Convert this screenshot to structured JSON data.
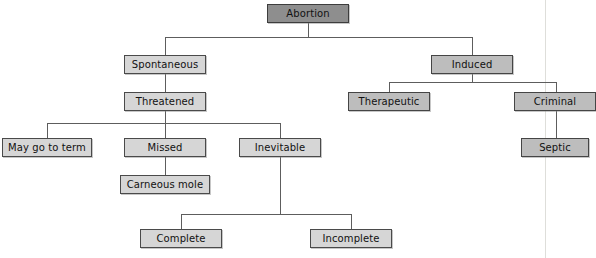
{
  "diagram": {
    "type": "flowchart",
    "background_color": "#ffffff",
    "line_color": "#5d5d5d",
    "colors": {
      "root_fill": "#8e8e8e",
      "mid_fill": "#bdbdbd",
      "leaf_fill": "#d6d6d6",
      "border": "#4a4a4a",
      "page_edge": "#d8d8d4"
    },
    "nodes": [
      {
        "id": "abortion",
        "label": "Abortion",
        "tone": "dark",
        "x": 267,
        "y": 4,
        "w": 82,
        "h": 19
      },
      {
        "id": "spontaneous",
        "label": "Spontaneous",
        "tone": "light",
        "x": 124,
        "y": 55,
        "w": 82,
        "h": 19
      },
      {
        "id": "induced",
        "label": "Induced",
        "tone": "mid",
        "x": 431,
        "y": 55,
        "w": 82,
        "h": 19
      },
      {
        "id": "threatened",
        "label": "Threatened",
        "tone": "light",
        "x": 124,
        "y": 92,
        "w": 82,
        "h": 19
      },
      {
        "id": "therapeutic",
        "label": "Therapeutic",
        "tone": "mid",
        "x": 348,
        "y": 92,
        "w": 82,
        "h": 19
      },
      {
        "id": "criminal",
        "label": "Criminal",
        "tone": "mid",
        "x": 514,
        "y": 92,
        "w": 82,
        "h": 19
      },
      {
        "id": "maygototerm",
        "label": "May go to term",
        "tone": "light",
        "x": 2,
        "y": 138,
        "w": 90,
        "h": 19
      },
      {
        "id": "missed",
        "label": "Missed",
        "tone": "light",
        "x": 124,
        "y": 138,
        "w": 82,
        "h": 19
      },
      {
        "id": "inevitable",
        "label": "Inevitable",
        "tone": "light",
        "x": 239,
        "y": 138,
        "w": 82,
        "h": 19
      },
      {
        "id": "septic",
        "label": "Septic",
        "tone": "mid",
        "x": 521,
        "y": 138,
        "w": 68,
        "h": 19
      },
      {
        "id": "carneousmole",
        "label": "Carneous mole",
        "tone": "light",
        "x": 120,
        "y": 175,
        "w": 90,
        "h": 19
      },
      {
        "id": "complete",
        "label": "Complete",
        "tone": "light",
        "x": 140,
        "y": 229,
        "w": 82,
        "h": 19
      },
      {
        "id": "incomplete",
        "label": "Incomplete",
        "tone": "light",
        "x": 310,
        "y": 229,
        "w": 82,
        "h": 19
      }
    ],
    "edges": [
      {
        "id": "abortion-drop",
        "from": "abortion",
        "to": "branch-bus-1",
        "orient": "v",
        "x": 308,
        "y": 23,
        "len": 14
      },
      {
        "id": "abortion-bus",
        "from": "abortion",
        "to": "children",
        "orient": "h",
        "x": 165,
        "y": 37,
        "len": 307
      },
      {
        "id": "spontaneous-riser",
        "from": "bus",
        "to": "spontaneous",
        "orient": "v",
        "x": 165,
        "y": 37,
        "len": 18
      },
      {
        "id": "induced-riser",
        "from": "bus",
        "to": "induced",
        "orient": "v",
        "x": 472,
        "y": 37,
        "len": 18
      },
      {
        "id": "spontaneous-threat",
        "from": "spontaneous",
        "to": "threatened",
        "orient": "v",
        "x": 165,
        "y": 74,
        "len": 18
      },
      {
        "id": "induced-drop",
        "from": "induced",
        "to": "bus2",
        "orient": "v",
        "x": 472,
        "y": 74,
        "len": 8
      },
      {
        "id": "induced-bus",
        "from": "induced",
        "to": "children",
        "orient": "h",
        "x": 389,
        "y": 82,
        "len": 167
      },
      {
        "id": "therapeutic-riser",
        "from": "bus2",
        "to": "therapeutic",
        "orient": "v",
        "x": 389,
        "y": 82,
        "len": 10
      },
      {
        "id": "criminal-riser",
        "from": "bus2",
        "to": "criminal",
        "orient": "v",
        "x": 556,
        "y": 82,
        "len": 10
      },
      {
        "id": "criminal-septic",
        "from": "criminal",
        "to": "septic",
        "orient": "v",
        "x": 556,
        "y": 111,
        "len": 27
      },
      {
        "id": "threatened-drop",
        "from": "threatened",
        "to": "bus3",
        "orient": "v",
        "x": 165,
        "y": 111,
        "len": 12
      },
      {
        "id": "threatened-bus",
        "from": "threatened",
        "to": "children",
        "orient": "h",
        "x": 47,
        "y": 123,
        "len": 233
      },
      {
        "id": "maygototerm-riser",
        "from": "bus3",
        "to": "maygototerm",
        "orient": "v",
        "x": 47,
        "y": 123,
        "len": 15
      },
      {
        "id": "missed-riser",
        "from": "bus3",
        "to": "missed",
        "orient": "v",
        "x": 165,
        "y": 123,
        "len": 15
      },
      {
        "id": "inevitable-riser",
        "from": "bus3",
        "to": "inevitable",
        "orient": "v",
        "x": 280,
        "y": 123,
        "len": 15
      },
      {
        "id": "missed-carneous",
        "from": "missed",
        "to": "carneousmole",
        "orient": "v",
        "x": 165,
        "y": 157,
        "len": 18
      },
      {
        "id": "inevitable-drop",
        "from": "inevitable",
        "to": "bus4",
        "orient": "v",
        "x": 280,
        "y": 157,
        "len": 57
      },
      {
        "id": "inevitable-bus",
        "from": "inevitable",
        "to": "children",
        "orient": "h",
        "x": 181,
        "y": 214,
        "len": 170
      },
      {
        "id": "complete-riser",
        "from": "bus4",
        "to": "complete",
        "orient": "v",
        "x": 181,
        "y": 214,
        "len": 15
      },
      {
        "id": "incomplete-riser",
        "from": "bus4",
        "to": "incomplete",
        "orient": "v",
        "x": 351,
        "y": 214,
        "len": 15
      }
    ],
    "page_edge_x": 545
  }
}
